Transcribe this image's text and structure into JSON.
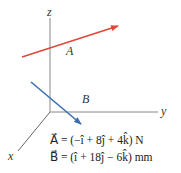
{
  "axes": {
    "z_label": "z",
    "y_label": "y",
    "x_label": "x",
    "color": "#777777"
  },
  "vectors": [
    {
      "name": "A",
      "label": "A⃗",
      "color": "#e0483a"
    },
    {
      "name": "B",
      "label": "B⃗",
      "color": "#3b6fb0"
    }
  ],
  "equations": {
    "A": "A⃗ = (−î + 8ĵ + 4k̂) N",
    "B": "B⃗ = (î + 18ĵ − 6k̂) mm"
  }
}
